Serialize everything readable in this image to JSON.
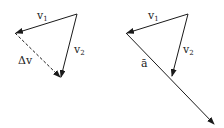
{
  "left_diagram": {
    "v1_label": "v",
    "v1_sub": "1",
    "v2_label": "v",
    "v2_sub": "2",
    "dv_label": "Δv"
  },
  "right_diagram": {
    "v1_label": "v",
    "v1_sub": "1",
    "v2_label": "v",
    "v2_sub": "2",
    "a_label": "ā"
  },
  "colors": {
    "stroke": "#1a1a1a"
  }
}
